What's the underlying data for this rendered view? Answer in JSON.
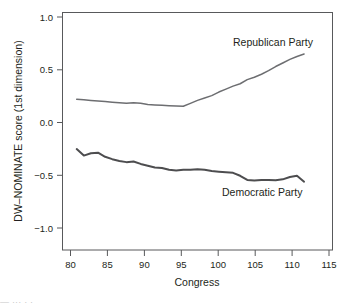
{
  "chart_data": {
    "type": "line",
    "title": "",
    "xlabel": "Congress",
    "ylabel": "DW–NOMINATE score (1st dimension)",
    "xlim": [
      78,
      116
    ],
    "ylim": [
      -1.0,
      1.0
    ],
    "grid": false,
    "legend_position": "inline-annotations",
    "xticks": [
      80,
      85,
      90,
      95,
      100,
      105,
      110,
      115
    ],
    "xtick_labels": [
      "80",
      "85",
      "90",
      "95",
      "100",
      "105",
      "110",
      "115"
    ],
    "yticks": [
      -1.0,
      -0.5,
      0.0,
      0.5,
      1.0
    ],
    "ytick_labels": [
      "−1.0",
      "−0.5",
      "0.0",
      "0.5",
      "1.0"
    ],
    "series": [
      {
        "name": "Republican Party",
        "color": "#6d6e71",
        "width": 1.5,
        "x": [
          80,
          81,
          82,
          83,
          84,
          85,
          86,
          87,
          88,
          89,
          90,
          91,
          92,
          93,
          94,
          95,
          96,
          97,
          98,
          99,
          100,
          101,
          102,
          103,
          104,
          105,
          106,
          107,
          108,
          109,
          110,
          111,
          112
        ],
        "values": [
          0.27,
          0.265,
          0.26,
          0.255,
          0.25,
          0.245,
          0.24,
          0.235,
          0.24,
          0.235,
          0.225,
          0.222,
          0.218,
          0.215,
          0.212,
          0.21,
          0.235,
          0.26,
          0.28,
          0.3,
          0.33,
          0.355,
          0.38,
          0.4,
          0.435,
          0.455,
          0.48,
          0.51,
          0.545,
          0.575,
          0.605,
          0.63,
          0.65
        ]
      },
      {
        "name": "Democratic Party",
        "color": "#4d4d4f",
        "width": 2.0,
        "x": [
          80,
          81,
          82,
          83,
          84,
          85,
          86,
          87,
          88,
          89,
          90,
          91,
          92,
          93,
          94,
          95,
          96,
          97,
          98,
          99,
          100,
          101,
          102,
          103,
          104,
          105,
          106,
          107,
          108,
          109,
          110,
          111,
          112
        ],
        "values": [
          -0.15,
          -0.205,
          -0.185,
          -0.18,
          -0.215,
          -0.235,
          -0.25,
          -0.26,
          -0.255,
          -0.275,
          -0.29,
          -0.305,
          -0.31,
          -0.325,
          -0.33,
          -0.325,
          -0.325,
          -0.32,
          -0.325,
          -0.335,
          -0.34,
          -0.345,
          -0.35,
          -0.375,
          -0.41,
          -0.415,
          -0.41,
          -0.41,
          -0.412,
          -0.405,
          -0.385,
          -0.375,
          -0.425
        ]
      }
    ],
    "annotations": [
      {
        "text": "Republican Party",
        "x_px": 233,
        "y_px": 46
      },
      {
        "text": "Democratic Party",
        "x_px": 222,
        "y_px": 196
      }
    ]
  },
  "caption": {
    "cut_off_text": "— ··· · ·"
  }
}
